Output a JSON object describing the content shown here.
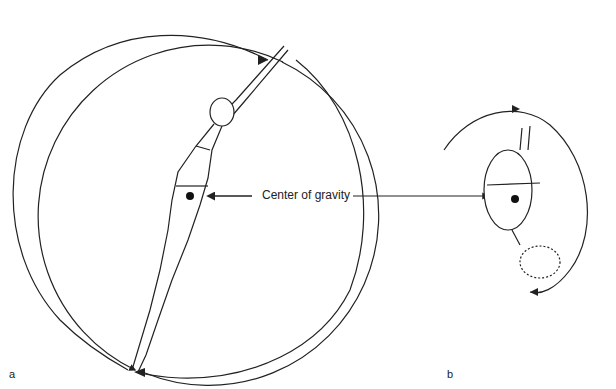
{
  "diagram": {
    "callout": "Center of gravity",
    "panels": [
      {
        "id": "a",
        "label": "a",
        "pose": "layout (extended body)",
        "rotation": "slow"
      },
      {
        "id": "b",
        "label": "b",
        "pose": "tuck",
        "rotation": "fast"
      }
    ],
    "colors": {
      "line": "#222222",
      "background": "#ffffff"
    }
  }
}
